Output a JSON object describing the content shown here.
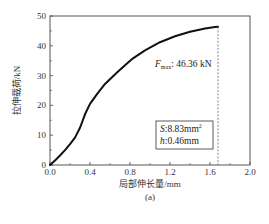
{
  "chart_data": {
    "type": "line",
    "title": "",
    "caption": "(a)",
    "xlabel": "局部伸长量/mm",
    "ylabel": "拉伸载荷/kN",
    "xlim": [
      0.0,
      2.0
    ],
    "ylim": [
      0,
      50
    ],
    "xticks": [
      "0.0",
      "0.4",
      "0.8",
      "1.2",
      "1.6",
      "2.0"
    ],
    "yticks": [
      "0",
      "10",
      "20",
      "30",
      "40",
      "50"
    ],
    "grid": false,
    "series": [
      {
        "name": "load-elongation",
        "x": [
          0.0,
          0.05,
          0.1,
          0.15,
          0.2,
          0.25,
          0.3,
          0.35,
          0.4,
          0.47,
          0.55,
          0.67,
          0.75,
          0.83,
          0.95,
          1.1,
          1.25,
          1.4,
          1.55,
          1.65,
          1.68
        ],
        "y": [
          0,
          1.5,
          3.2,
          5.0,
          7.0,
          9.2,
          12.5,
          17.0,
          20.5,
          23.8,
          27.2,
          31.0,
          33.5,
          35.8,
          38.5,
          41.2,
          43.2,
          44.7,
          45.8,
          46.3,
          46.36
        ]
      }
    ],
    "annotations": [
      {
        "text_main": "F",
        "text_sub": "max",
        "text_rest": ": 46.36 kN",
        "x": 1.05,
        "y": 33
      },
      {
        "type": "dashed-vline",
        "x": 1.68,
        "from_y": 0,
        "to_y": 46.36
      }
    ],
    "legend_box": {
      "line1_italic": "S",
      "line1_rest": ":8.83mm",
      "line1_sup": "2",
      "line2_italic": "h",
      "line2_rest": ":0.46mm"
    }
  }
}
